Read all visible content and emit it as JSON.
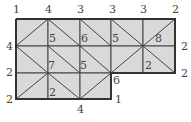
{
  "puzzle": {
    "type": "slant-grid-vertex-clues",
    "cols": 5,
    "rows": 3,
    "cell_fill": "#d9d9d9",
    "line_color": "#444444",
    "border_color": "#333333",
    "cells": [
      {
        "r": 0,
        "c": 0,
        "diag": "/"
      },
      {
        "r": 0,
        "c": 1,
        "diag": "\\"
      },
      {
        "r": 0,
        "c": 2,
        "diag": "\\"
      },
      {
        "r": 0,
        "c": 3,
        "diag": "\\"
      },
      {
        "r": 0,
        "c": 4,
        "diag": "/"
      },
      {
        "r": 1,
        "c": 0,
        "diag": "\\"
      },
      {
        "r": 1,
        "c": 1,
        "diag": "\\"
      },
      {
        "r": 1,
        "c": 2,
        "diag": "\\"
      },
      {
        "r": 1,
        "c": 3,
        "diag": "/"
      },
      {
        "r": 1,
        "c": 4,
        "diag": "\\"
      },
      {
        "r": 2,
        "c": 0,
        "diag": "/"
      },
      {
        "r": 2,
        "c": 1,
        "diag": "\\"
      },
      {
        "r": 2,
        "c": 2,
        "diag": "/"
      }
    ],
    "labels": [
      {
        "text": "1",
        "x": 13,
        "y": 4
      },
      {
        "text": "4",
        "x": 45,
        "y": 4
      },
      {
        "text": "3",
        "x": 77,
        "y": 4
      },
      {
        "text": "3",
        "x": 109,
        "y": 4
      },
      {
        "text": "3",
        "x": 140,
        "y": 4
      },
      {
        "text": "2",
        "x": 172,
        "y": 4
      },
      {
        "text": "4",
        "x": 6,
        "y": 41
      },
      {
        "text": "2",
        "x": 6,
        "y": 67
      },
      {
        "text": "2",
        "x": 6,
        "y": 94
      },
      {
        "text": "5",
        "x": 49,
        "y": 33
      },
      {
        "text": "6",
        "x": 81,
        "y": 33
      },
      {
        "text": "5",
        "x": 112,
        "y": 33
      },
      {
        "text": "8",
        "x": 155,
        "y": 33
      },
      {
        "text": "2",
        "x": 181,
        "y": 41
      },
      {
        "text": "7",
        "x": 48,
        "y": 60
      },
      {
        "text": "5",
        "x": 80,
        "y": 60
      },
      {
        "text": "2",
        "x": 145,
        "y": 60
      },
      {
        "text": "2",
        "x": 181,
        "y": 68
      },
      {
        "text": "6",
        "x": 113,
        "y": 75
      },
      {
        "text": "2",
        "x": 49,
        "y": 87
      },
      {
        "text": "1",
        "x": 115,
        "y": 94
      },
      {
        "text": "4",
        "x": 77,
        "y": 104
      }
    ]
  }
}
